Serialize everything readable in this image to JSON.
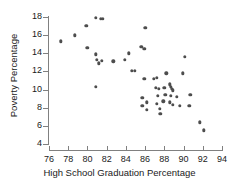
{
  "chart_data": {
    "type": "scatter",
    "title": "",
    "xlabel": "High School Graduation Percentage",
    "ylabel": "Poverty Percentage",
    "xlim": [
      76,
      94
    ],
    "ylim": [
      4,
      18
    ],
    "xticks": [
      76,
      78,
      80,
      82,
      84,
      86,
      88,
      90,
      92,
      94
    ],
    "yticks": [
      4,
      6,
      8,
      10,
      12,
      14,
      16,
      18
    ],
    "grid": false,
    "legend": null,
    "marker": {
      "shape": "circle",
      "color": "#4d4d4d",
      "size": 3.4
    },
    "series": [
      {
        "name": "States",
        "points": [
          [
            77.2,
            15.3
          ],
          [
            78.7,
            16.0
          ],
          [
            79.9,
            17.0
          ],
          [
            80.0,
            14.6
          ],
          [
            80.9,
            17.9
          ],
          [
            81.4,
            17.8
          ],
          [
            81.6,
            17.8
          ],
          [
            80.9,
            13.9
          ],
          [
            81.0,
            13.3
          ],
          [
            81.2,
            12.9
          ],
          [
            81.5,
            13.2
          ],
          [
            80.9,
            10.3
          ],
          [
            82.7,
            13.1
          ],
          [
            83.9,
            13.3
          ],
          [
            84.3,
            14.0
          ],
          [
            84.6,
            12.1
          ],
          [
            84.9,
            12.1
          ],
          [
            85.6,
            14.7
          ],
          [
            86.0,
            16.8
          ],
          [
            85.9,
            14.5
          ],
          [
            85.9,
            11.2
          ],
          [
            85.7,
            9.1
          ],
          [
            85.7,
            8.2
          ],
          [
            86.2,
            8.6
          ],
          [
            86.2,
            7.8
          ],
          [
            86.9,
            11.2
          ],
          [
            87.2,
            11.3
          ],
          [
            87.1,
            10.2
          ],
          [
            87.4,
            10.1
          ],
          [
            87.3,
            9.3
          ],
          [
            87.2,
            8.4
          ],
          [
            87.5,
            7.9
          ],
          [
            87.6,
            7.3
          ],
          [
            88.2,
            11.8
          ],
          [
            88.0,
            10.2
          ],
          [
            88.1,
            9.4
          ],
          [
            87.9,
            8.7
          ],
          [
            88.6,
            10.6
          ],
          [
            88.7,
            10.3
          ],
          [
            88.8,
            10.1
          ],
          [
            88.9,
            9.9
          ],
          [
            88.7,
            9.3
          ],
          [
            88.6,
            8.6
          ],
          [
            88.9,
            8.3
          ],
          [
            89.3,
            9.2
          ],
          [
            89.6,
            8.2
          ],
          [
            89.9,
            11.8
          ],
          [
            90.1,
            13.6
          ],
          [
            90.7,
            9.4
          ],
          [
            90.6,
            8.2
          ],
          [
            91.7,
            6.4
          ],
          [
            92.1,
            5.5
          ]
        ]
      }
    ]
  },
  "axes": {
    "y_tick_labels": [
      "18",
      "16",
      "14",
      "12",
      "10",
      "8",
      "6",
      "4"
    ],
    "x_tick_labels": [
      "76",
      "78",
      "80",
      "82",
      "84",
      "86",
      "88",
      "90",
      "92",
      "94"
    ]
  }
}
